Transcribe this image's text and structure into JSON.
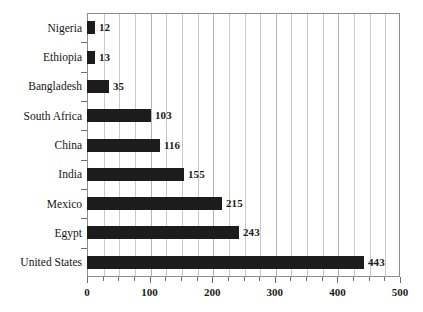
{
  "chart_data": {
    "type": "bar",
    "orientation": "horizontal",
    "title": "",
    "subtitle": "",
    "xlabel": "",
    "ylabel": "",
    "xlim": [
      0,
      500
    ],
    "xticks": [
      0,
      100,
      200,
      300,
      400,
      500
    ],
    "xtick_labels": [
      "0",
      "100",
      "200",
      "300",
      "400",
      "500"
    ],
    "minor_tick_step": 25,
    "grid": true,
    "grid_axis": "x",
    "legend": false,
    "legend_position": "none",
    "bar_color": "#1c1c1c",
    "grid_color": "#c9c9c9",
    "frame_color": "#8d8d8d",
    "categories": [
      "Nigeria",
      "Ethiopia",
      "Bangladesh",
      "South Africa",
      "China",
      "India",
      "Mexico",
      "Egypt",
      "United States"
    ],
    "values": [
      12,
      13,
      35,
      103,
      116,
      155,
      215,
      243,
      443
    ],
    "value_labels": [
      "12",
      "13",
      "35",
      "103",
      "116",
      "155",
      "215",
      "243",
      "443"
    ]
  }
}
